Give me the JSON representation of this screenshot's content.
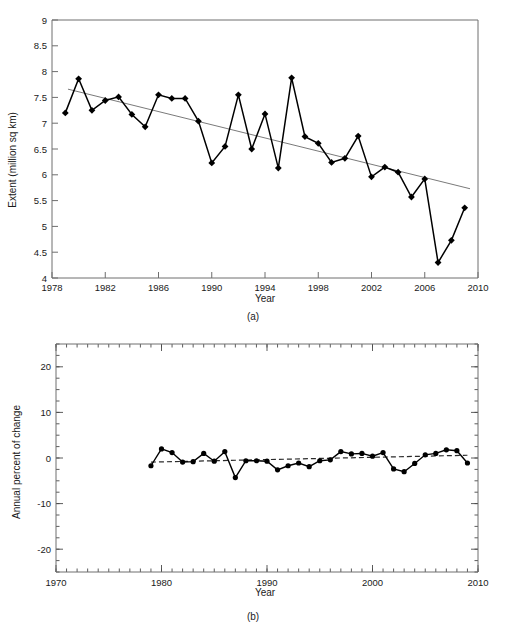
{
  "figure": {
    "panel_a_label": "(a)",
    "panel_b_label": "(b)"
  },
  "chart_data": [
    {
      "id": "a",
      "type": "line",
      "title": "",
      "xlabel": "Year",
      "ylabel": "Extent (million sq km)",
      "xlim": [
        1978,
        2010
      ],
      "ylim": [
        4,
        9
      ],
      "xticks": [
        1978,
        1982,
        1986,
        1990,
        1994,
        1998,
        2002,
        2006,
        2010
      ],
      "xtick_labels": [
        "1978",
        "1982",
        "1986",
        "1990",
        "1994",
        "1998",
        "2002",
        "2006",
        "2010"
      ],
      "yticks": [
        4,
        4.5,
        5,
        5.5,
        6,
        6.5,
        7,
        7.5,
        8,
        8.5,
        9
      ],
      "ytick_labels": [
        "4",
        "4.5",
        "5",
        "5.5",
        "6",
        "6.5",
        "7",
        "7.5",
        "8",
        "8.5",
        "9"
      ],
      "grid": false,
      "legend": "none",
      "marker": "diamond",
      "series": [
        {
          "name": "September sea ice extent",
          "x": [
            1979,
            1980,
            1981,
            1982,
            1983,
            1984,
            1985,
            1986,
            1987,
            1988,
            1989,
            1990,
            1991,
            1992,
            1993,
            1994,
            1995,
            1996,
            1997,
            1998,
            1999,
            2000,
            2001,
            2002,
            2003,
            2004,
            2005,
            2006,
            2007,
            2008,
            2009
          ],
          "values": [
            7.2,
            7.86,
            7.25,
            7.44,
            7.51,
            7.17,
            6.93,
            7.55,
            7.48,
            7.48,
            7.04,
            6.23,
            6.55,
            7.55,
            6.5,
            7.18,
            6.13,
            7.88,
            6.74,
            6.61,
            6.24,
            6.32,
            6.75,
            5.96,
            6.15,
            6.05,
            5.57,
            5.92,
            4.3,
            4.73,
            5.36
          ]
        }
      ],
      "trendline": {
        "name": "linear trend",
        "x": [
          1979.2,
          2009.4
        ],
        "values": [
          7.66,
          5.73
        ],
        "style": "solid",
        "color": "#7a7a7a"
      }
    },
    {
      "id": "b",
      "type": "line",
      "title": "",
      "xlabel": "Year",
      "ylabel": "Annual percent of change",
      "xlim": [
        1970,
        2010
      ],
      "ylim": [
        -25,
        25
      ],
      "xticks": [
        1970,
        1980,
        1990,
        2000,
        2010
      ],
      "xtick_labels": [
        "1970",
        "1980",
        "1990",
        "2000",
        "2010"
      ],
      "yticks": [
        -20,
        -10,
        0,
        10,
        20
      ],
      "ytick_labels": [
        "-20",
        "-10",
        "0",
        "10",
        "20"
      ],
      "grid": false,
      "legend": "none",
      "marker": "circle",
      "series": [
        {
          "name": "Annual percent of change",
          "x": [
            1979,
            1980,
            1981,
            1982,
            1983,
            1984,
            1985,
            1986,
            1987,
            1988,
            1989,
            1990,
            1991,
            1992,
            1993,
            1994,
            1995,
            1996,
            1997,
            1998,
            1999,
            2000,
            2001,
            2002,
            2003,
            2004,
            2005,
            2006,
            2007,
            2008,
            2009
          ],
          "values": [
            -1.7,
            2.0,
            1.2,
            -0.9,
            -0.8,
            1.0,
            -0.7,
            1.4,
            -4.3,
            -0.6,
            -0.6,
            -0.7,
            -2.6,
            -1.7,
            -1.1,
            -1.9,
            -0.6,
            -0.4,
            1.4,
            0.9,
            1.0,
            0.4,
            1.2,
            -2.4,
            -3.0,
            -1.2,
            0.7,
            1.0,
            1.8,
            1.6,
            -1.1,
            0.9
          ]
        }
      ],
      "trendline": {
        "name": "linear trend",
        "x": [
          1979,
          2009
        ],
        "values": [
          -0.9,
          0.6
        ],
        "style": "dashed",
        "color": "#2b2b2b"
      }
    }
  ]
}
